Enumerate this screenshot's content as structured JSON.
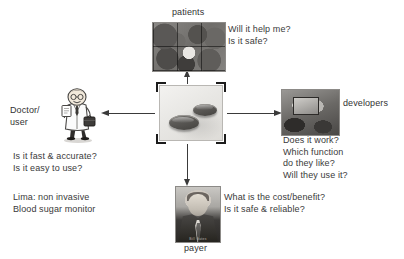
{
  "diagram": {
    "center": {
      "node_name": "Lima device",
      "icon": "device-photo",
      "selected": true
    },
    "stakeholders": [
      {
        "id": "patients",
        "label": "patients",
        "icon": "patients-collage-photo",
        "questions": "Will it help me?\nIs it safe?",
        "arrow": "up-arrow"
      },
      {
        "id": "doctor-user",
        "label": "Doctor/\nuser",
        "icon": "doctor-clipart",
        "questions": "Is it fast & accurate?\nIs it easy to use?",
        "arrow": "left-arrow"
      },
      {
        "id": "developers",
        "label": "developers",
        "icon": "developers-photo",
        "questions": "Does it work?\nWhich function\ndo they like?\nWill they use it?",
        "arrow": "right-arrow"
      },
      {
        "id": "payer",
        "label": "payer",
        "icon": "payer-portrait-photo",
        "questions": "What is the cost/benefit?\nIs it safe & reliable?",
        "arrow": "down-arrow",
        "photo_credit": "Bill Gates"
      }
    ],
    "product_note": "Lima: non invasive\nBlood sugar monitor"
  },
  "colors": {
    "background": "#ffffff",
    "text": "#3a3a3a",
    "arrow": "#3a3a3a",
    "photo_border": "#8c8a87",
    "handle": "#1c1c1c"
  }
}
